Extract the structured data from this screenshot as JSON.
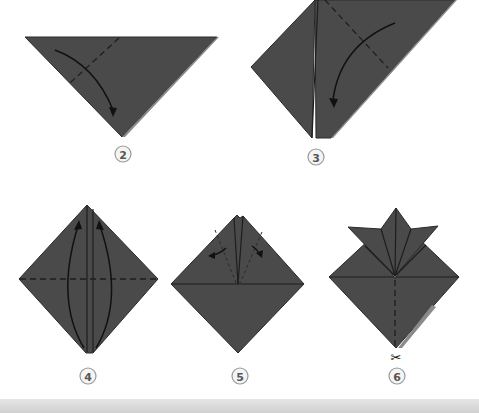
{
  "diagram": {
    "colors": {
      "paper": "#4a4a4a",
      "background": "#ffffff",
      "step_badge_fill": "#f4f4f4",
      "step_badge_stroke": "#9a9a9a"
    },
    "steps": [
      {
        "number": "2",
        "description": "Triangle pointing down; fold left corner down along dashed line (arrow)"
      },
      {
        "number": "3",
        "description": "Tilted rectangle; fold top-right down along dashed line (arrow)"
      },
      {
        "number": "4",
        "description": "Diamond with horizontal dashed line; fold bottom points up (two arrows)"
      },
      {
        "number": "5",
        "description": "Diamond with top flaps; fold flaps outward along dashed lines (two small arrows)"
      },
      {
        "number": "6",
        "description": "Helmet shape with horns; cut along vertical dashed line"
      }
    ],
    "cut_symbol": "✂"
  }
}
